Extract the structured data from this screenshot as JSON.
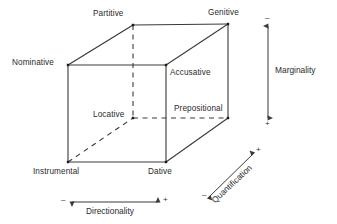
{
  "diagram": {
    "type": "3d-cube-semantic-space",
    "colors": {
      "line": "#3a3a3a",
      "text": "#2b2b2b",
      "background": "#ffffff",
      "vertex_dot": "#1a1a1a"
    },
    "vertices": [
      {
        "id": "partitive",
        "label": "Partitive",
        "x": 133,
        "y": 25,
        "label_x": 93,
        "label_y": 10,
        "face": "back"
      },
      {
        "id": "genitive",
        "label": "Genitive",
        "x": 228,
        "y": 24,
        "label_x": 208,
        "label_y": 9,
        "face": "back"
      },
      {
        "id": "nominative",
        "label": "Nominative",
        "x": 68,
        "y": 65,
        "label_x": 12,
        "label_y": 59,
        "face": "front"
      },
      {
        "id": "accusative",
        "label": "Accusative",
        "x": 166,
        "y": 65,
        "label_x": 170,
        "label_y": 69,
        "face": "front"
      },
      {
        "id": "locative",
        "label": "Locative",
        "x": 133,
        "y": 118,
        "label_x": 93,
        "label_y": 111,
        "face": "back"
      },
      {
        "id": "prepositional",
        "label": "Prepositional",
        "x": 228,
        "y": 118,
        "label_x": 173,
        "label_y": 105,
        "face": "back"
      },
      {
        "id": "instrumental",
        "label": "Instrumental",
        "x": 68,
        "y": 162,
        "label_x": 33,
        "label_y": 168,
        "face": "front"
      },
      {
        "id": "dative",
        "label": "Dative",
        "x": 166,
        "y": 162,
        "label_x": 148,
        "label_y": 168,
        "face": "front"
      }
    ],
    "edges": [
      {
        "from": "nominative",
        "to": "accusative",
        "style": "solid"
      },
      {
        "from": "nominative",
        "to": "instrumental",
        "style": "solid"
      },
      {
        "from": "accusative",
        "to": "dative",
        "style": "solid"
      },
      {
        "from": "instrumental",
        "to": "dative",
        "style": "solid"
      },
      {
        "from": "partitive",
        "to": "genitive",
        "style": "solid"
      },
      {
        "from": "genitive",
        "to": "prepositional",
        "style": "solid"
      },
      {
        "from": "nominative",
        "to": "partitive",
        "style": "solid"
      },
      {
        "from": "accusative",
        "to": "genitive",
        "style": "solid"
      },
      {
        "from": "dative",
        "to": "prepositional",
        "style": "solid"
      },
      {
        "from": "partitive",
        "to": "locative",
        "style": "dashed"
      },
      {
        "from": "locative",
        "to": "prepositional",
        "style": "dashed"
      },
      {
        "from": "instrumental",
        "to": "locative",
        "style": "dashed"
      }
    ],
    "axes": [
      {
        "id": "marginality",
        "label": "Marginality",
        "orientation": "vertical",
        "x1": 268,
        "y1": 26,
        "x2": 268,
        "y2": 118,
        "arrow": "double",
        "start_sign": "–",
        "end_sign": "+",
        "label_x": 275,
        "label_y": 66,
        "start_sign_x": 265,
        "start_sign_y": 15,
        "end_sign_x": 265,
        "end_sign_y": 121
      },
      {
        "id": "directionality",
        "label": "Directionality",
        "orientation": "horizontal",
        "x1": 72,
        "y1": 202,
        "x2": 158,
        "y2": 202,
        "arrow": "double",
        "start_sign": "–",
        "end_sign": "+",
        "label_x": 86,
        "label_y": 207,
        "start_sign_x": 61,
        "start_sign_y": 197,
        "end_sign_x": 163,
        "end_sign_y": 197
      },
      {
        "id": "quantification",
        "label": "Quantification",
        "orientation": "diagonal",
        "x1": 209,
        "y1": 197,
        "x2": 253,
        "y2": 154,
        "arrow": "double",
        "start_sign": "–",
        "end_sign": "+",
        "label_x": 216,
        "label_y": 202,
        "start_sign_x": 203,
        "start_sign_y": 192,
        "end_sign_x": 257,
        "end_sign_y": 148
      }
    ]
  }
}
